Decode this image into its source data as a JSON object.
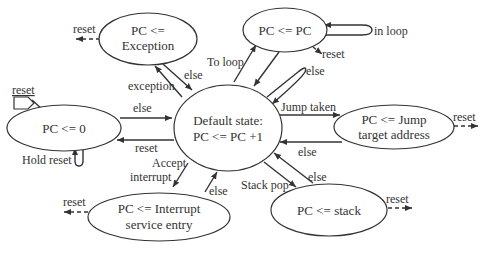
{
  "diagram": {
    "type": "state-machine",
    "nodes": {
      "default": {
        "line1": "Default state:",
        "line2": "PC <= PC +1"
      },
      "zero": {
        "line1": "PC <= 0"
      },
      "exception": {
        "line1": "PC <=",
        "line2": "Exception"
      },
      "loop": {
        "line1": "PC <= PC"
      },
      "jump": {
        "line1": "PC <= Jump",
        "line2": "target address"
      },
      "stack": {
        "line1": "PC <= stack"
      },
      "interrupt": {
        "line1": "PC <= Interrupt",
        "line2": "service entry"
      }
    },
    "edges": {
      "reset_entry": "reset",
      "zero_to_default": "else",
      "default_to_zero": "reset",
      "hold_reset": "Hold reset",
      "default_to_exception": "exception",
      "exception_to_default": "else",
      "exception_reset": "reset",
      "default_to_loop": "To loop",
      "loop_self": "in loop",
      "loop_reset": "reset",
      "default_self": "else",
      "default_to_jump": "Jump taken",
      "jump_to_default": "else",
      "jump_reset": "reset",
      "default_to_stack": "Stack pop",
      "stack_to_default": "else",
      "stack_reset": "reset",
      "default_to_interrupt_1": "Accept",
      "default_to_interrupt_2": "interrupt",
      "interrupt_to_default": "else",
      "interrupt_reset": "reset"
    }
  }
}
